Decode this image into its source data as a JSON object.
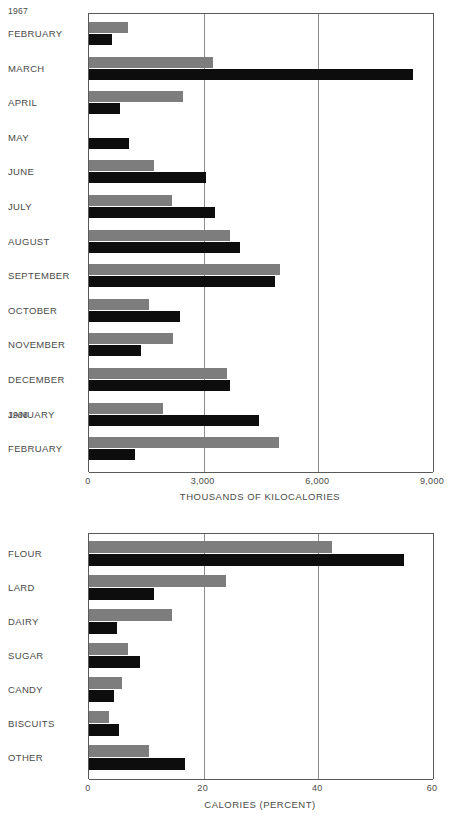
{
  "chart_data": [
    {
      "id": "monthly-energy",
      "type": "bar",
      "orientation": "horizontal",
      "title": "",
      "xlabel": "THOUSANDS OF KILOCALORIES",
      "ylabel": "",
      "xlim": [
        0,
        9000
      ],
      "xticks": [
        0,
        3000,
        6000,
        9000
      ],
      "xticklabels": [
        "0",
        "3,000",
        "6,000",
        "9,000"
      ],
      "gridlines": [
        3000,
        6000
      ],
      "grid": true,
      "legend": "none",
      "group_labels": [
        "1967",
        "1968"
      ],
      "categories": [
        "FEBRUARY",
        "MARCH",
        "APRIL",
        "MAY",
        "JUNE",
        "JULY",
        "AUGUST",
        "SEPTEMBER",
        "OCTOBER",
        "NOVEMBER",
        "DECEMBER",
        "JANUARY",
        "FEBRUARY"
      ],
      "series": [
        {
          "name": "gray",
          "color": "#7d7d7d",
          "values": [
            1020,
            3250,
            2450,
            0,
            1700,
            2170,
            3690,
            5000,
            1570,
            2200,
            3600,
            1940,
            4970
          ]
        },
        {
          "name": "black",
          "color": "#0d0d0d",
          "values": [
            600,
            8475,
            820,
            1040,
            3060,
            3300,
            3950,
            4870,
            2380,
            1360,
            3700,
            4440,
            1200
          ]
        }
      ]
    },
    {
      "id": "calorie-sources",
      "type": "bar",
      "orientation": "horizontal",
      "title": "",
      "xlabel": "CALORIES  (PERCENT)",
      "ylabel": "",
      "xlim": [
        0,
        60
      ],
      "xticks": [
        0,
        20,
        40,
        60
      ],
      "xticklabels": [
        "0",
        "20",
        "40",
        "60"
      ],
      "gridlines": [
        20,
        40
      ],
      "grid": true,
      "legend": "none",
      "categories": [
        "FLOUR",
        "LARD",
        "DAIRY",
        "SUGAR",
        "CANDY",
        "BISCUITS",
        "OTHER"
      ],
      "series": [
        {
          "name": "gray",
          "color": "#7d7d7d",
          "values": [
            42.4,
            23.9,
            14.5,
            6.8,
            5.7,
            3.5,
            10.5
          ]
        },
        {
          "name": "black",
          "color": "#0d0d0d",
          "values": [
            55.0,
            11.3,
            4.9,
            8.9,
            4.4,
            5.2,
            16.7
          ]
        }
      ]
    }
  ]
}
